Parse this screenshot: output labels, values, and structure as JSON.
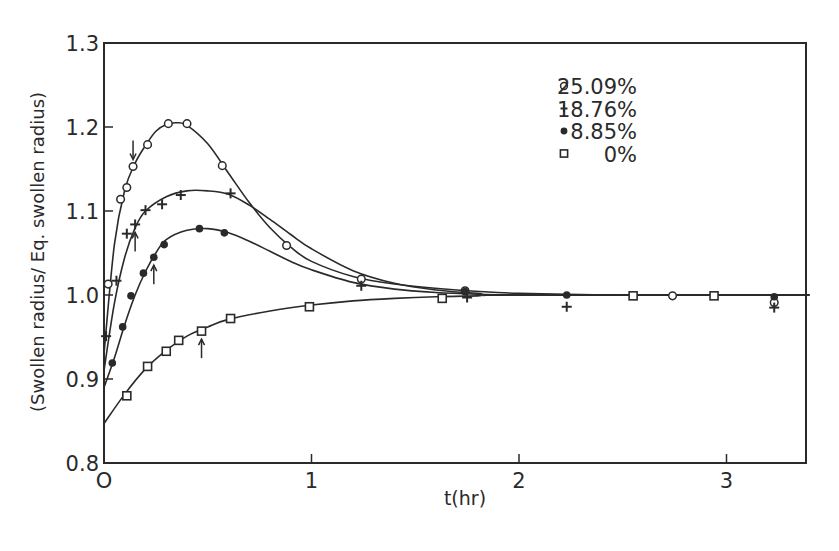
{
  "chart_data": {
    "type": "scatter",
    "title": "",
    "xlabel": "t(hr)",
    "ylabel": "(Swollen radius/ Eq. swollen radius)",
    "xlim": [
      0,
      3.4
    ],
    "ylim": [
      0.8,
      1.3
    ],
    "x_ticks": [
      "O",
      "1",
      "2",
      "3"
    ],
    "x_tick_values": [
      0,
      1,
      2,
      3
    ],
    "y_ticks": [
      "0.8",
      "0.9",
      "1.0",
      "1.1",
      "1.2",
      "1.3"
    ],
    "y_tick_values": [
      0.8,
      0.9,
      1.0,
      1.1,
      1.2,
      1.3
    ],
    "grid": false,
    "legend_position": "upper right",
    "series": [
      {
        "name": "25.09%",
        "marker": "open-circle",
        "points": [
          [
            0.02,
            1.013
          ],
          [
            0.08,
            1.114
          ],
          [
            0.11,
            1.128
          ],
          [
            0.14,
            1.153
          ],
          [
            0.21,
            1.179
          ],
          [
            0.31,
            1.204
          ],
          [
            0.4,
            1.204
          ],
          [
            0.57,
            1.154
          ],
          [
            0.88,
            1.059
          ],
          [
            1.24,
            1.019
          ],
          [
            1.74,
            1.005
          ],
          [
            2.74,
            0.999
          ],
          [
            3.23,
            0.991
          ]
        ],
        "curve": [
          [
            0,
            0.93
          ],
          [
            0.05,
            1.06
          ],
          [
            0.1,
            1.125
          ],
          [
            0.15,
            1.157
          ],
          [
            0.2,
            1.178
          ],
          [
            0.25,
            1.195
          ],
          [
            0.3,
            1.203
          ],
          [
            0.35,
            1.205
          ],
          [
            0.4,
            1.202
          ],
          [
            0.5,
            1.18
          ],
          [
            0.6,
            1.145
          ],
          [
            0.7,
            1.11
          ],
          [
            0.8,
            1.08
          ],
          [
            0.9,
            1.057
          ],
          [
            1.0,
            1.04
          ],
          [
            1.2,
            1.022
          ],
          [
            1.4,
            1.013
          ],
          [
            1.7,
            1.006
          ],
          [
            2.0,
            1.002
          ],
          [
            2.5,
            1.0
          ],
          [
            3.4,
            1.0
          ]
        ]
      },
      {
        "name": "18.76%",
        "marker": "plus",
        "points": [
          [
            0.01,
            0.951
          ],
          [
            0.06,
            1.017
          ],
          [
            0.11,
            1.073
          ],
          [
            0.15,
            1.084
          ],
          [
            0.2,
            1.101
          ],
          [
            0.28,
            1.108
          ],
          [
            0.37,
            1.119
          ],
          [
            0.61,
            1.121
          ],
          [
            1.24,
            1.011
          ],
          [
            1.75,
            0.997
          ],
          [
            2.23,
            0.986
          ],
          [
            3.23,
            0.985
          ]
        ],
        "curve": [
          [
            0,
            0.91
          ],
          [
            0.05,
            0.99
          ],
          [
            0.1,
            1.045
          ],
          [
            0.15,
            1.08
          ],
          [
            0.2,
            1.1
          ],
          [
            0.3,
            1.117
          ],
          [
            0.4,
            1.124
          ],
          [
            0.5,
            1.124
          ],
          [
            0.6,
            1.12
          ],
          [
            0.7,
            1.107
          ],
          [
            0.8,
            1.09
          ],
          [
            0.9,
            1.072
          ],
          [
            1.0,
            1.055
          ],
          [
            1.2,
            1.029
          ],
          [
            1.4,
            1.014
          ],
          [
            1.6,
            1.006
          ],
          [
            1.8,
            1.002
          ],
          [
            2.0,
            1.0
          ],
          [
            3.4,
            1.0
          ]
        ]
      },
      {
        "name": "8.85%",
        "marker": "filled-circle",
        "points": [
          [
            0.04,
            0.919
          ],
          [
            0.09,
            0.962
          ],
          [
            0.13,
            0.999
          ],
          [
            0.19,
            1.026
          ],
          [
            0.24,
            1.045
          ],
          [
            0.29,
            1.06
          ],
          [
            0.46,
            1.079
          ],
          [
            0.58,
            1.074
          ],
          [
            1.74,
            1.004
          ],
          [
            2.23,
            1.0
          ],
          [
            3.23,
            0.998
          ]
        ],
        "curve": [
          [
            0,
            0.89
          ],
          [
            0.05,
            0.925
          ],
          [
            0.1,
            0.965
          ],
          [
            0.15,
            1.0
          ],
          [
            0.2,
            1.028
          ],
          [
            0.25,
            1.05
          ],
          [
            0.3,
            1.066
          ],
          [
            0.4,
            1.077
          ],
          [
            0.5,
            1.079
          ],
          [
            0.6,
            1.074
          ],
          [
            0.7,
            1.064
          ],
          [
            0.8,
            1.052
          ],
          [
            0.9,
            1.04
          ],
          [
            1.0,
            1.03
          ],
          [
            1.2,
            1.015
          ],
          [
            1.4,
            1.007
          ],
          [
            1.6,
            1.003
          ],
          [
            1.8,
            1.001
          ],
          [
            2.0,
            1.0
          ],
          [
            3.4,
            1.0
          ]
        ]
      },
      {
        "name": "0%",
        "marker": "open-square",
        "points": [
          [
            0.11,
            0.88
          ],
          [
            0.21,
            0.915
          ],
          [
            0.3,
            0.933
          ],
          [
            0.36,
            0.946
          ],
          [
            0.47,
            0.957
          ],
          [
            0.61,
            0.972
          ],
          [
            0.99,
            0.986
          ],
          [
            1.63,
            0.996
          ],
          [
            2.55,
            0.999
          ],
          [
            2.94,
            0.999
          ]
        ],
        "curve": [
          [
            0,
            0.847
          ],
          [
            0.1,
            0.882
          ],
          [
            0.2,
            0.912
          ],
          [
            0.3,
            0.934
          ],
          [
            0.4,
            0.951
          ],
          [
            0.5,
            0.962
          ],
          [
            0.6,
            0.971
          ],
          [
            0.8,
            0.981
          ],
          [
            1.0,
            0.988
          ],
          [
            1.2,
            0.993
          ],
          [
            1.4,
            0.996
          ],
          [
            1.6,
            0.998
          ],
          [
            1.8,
            0.999
          ],
          [
            2.0,
            1.0
          ],
          [
            3.4,
            1.0
          ]
        ]
      }
    ],
    "annotations": [
      {
        "type": "arrow-down",
        "series": "25.09%",
        "at": [
          0.14,
          1.153
        ]
      },
      {
        "type": "arrow-up",
        "series": "18.76%",
        "at": [
          0.15,
          1.084
        ]
      },
      {
        "type": "arrow-up",
        "series": "8.85%",
        "at": [
          0.24,
          1.045
        ]
      },
      {
        "type": "arrow-up",
        "series": "0%",
        "at": [
          0.47,
          0.957
        ]
      }
    ]
  }
}
